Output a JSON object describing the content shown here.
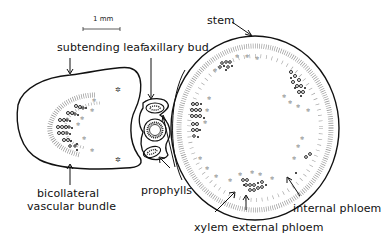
{
  "figure": {
    "type": "botanical cross-section diagram",
    "scale_bar": {
      "label": "1 mm"
    },
    "labels": {
      "stem": "stem",
      "subtending_leaf": "subtending leaf",
      "axillary_bud": "axillary bud",
      "bicollateral_line1": "bicollateral",
      "bicollateral_line2": "vascular bundle",
      "prophylls": "prophylls",
      "internal_phloem": "internal phloem",
      "xylem": "xylem",
      "external_phloem": "external phloem"
    },
    "colors": {
      "ink": "#111111",
      "background": "#ffffff"
    }
  }
}
